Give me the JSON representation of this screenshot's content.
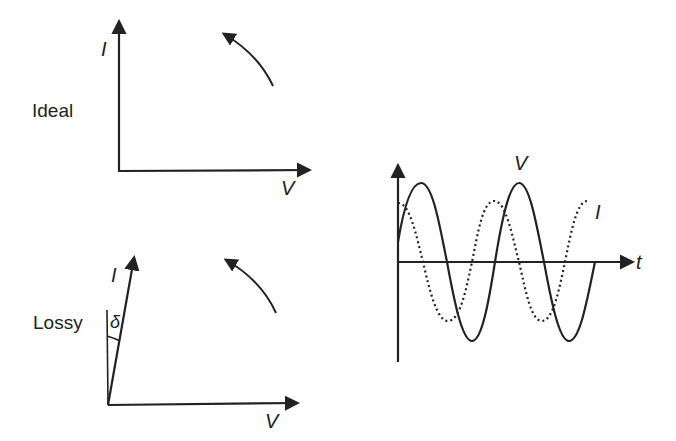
{
  "panels": {
    "ideal": {
      "row_label": "Ideal",
      "y_axis_label": "I",
      "x_axis_label": "V",
      "phase_angle_deg": 90,
      "rotation_arrow": "counterclockwise-arrow"
    },
    "lossy": {
      "row_label": "Lossy",
      "y_axis_label": "I",
      "x_axis_label": "V",
      "angle_label": "δ",
      "rotation_arrow": "counterclockwise-arrow"
    },
    "waveform": {
      "x_axis_label": "t",
      "voltage_label": "V",
      "current_label": "I",
      "voltage_style": "solid",
      "current_style": "dotted"
    }
  },
  "colors": {
    "ink": "#222222",
    "background": "#ffffff"
  }
}
